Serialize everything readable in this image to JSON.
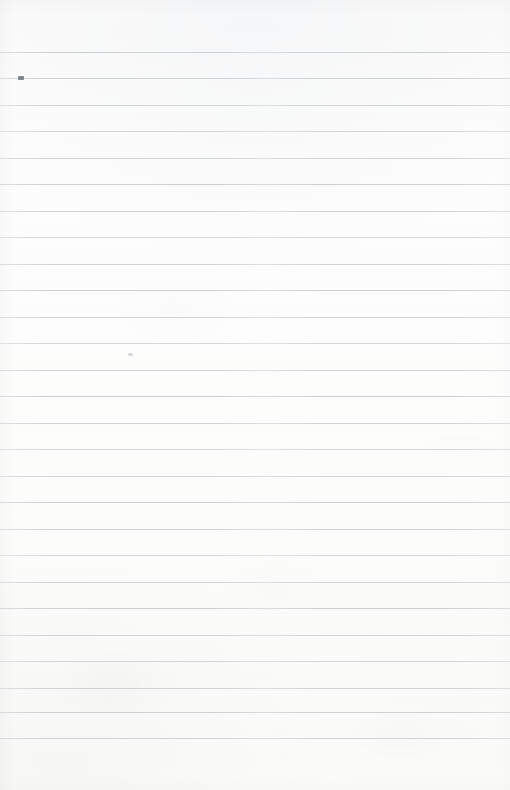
{
  "document": {
    "kind": "lined-notebook-paper-scan",
    "orientation": "portrait",
    "width_px": 510,
    "height_px": 790,
    "written_content": "",
    "visible_text": ""
  },
  "paper": {
    "background_color": "#fcfcfc",
    "rule_color": "#c9ced1",
    "rule_thickness_px": 1,
    "rule_spacing_px": 26.4,
    "first_rule_y": 52,
    "last_rule_y": 738,
    "rule_count": 27,
    "rule_left_x": 0,
    "rule_right_x": 510,
    "has_vertical_margin_rule": false,
    "has_punch_holes": false,
    "top_margin_px": 52,
    "bottom_margin_px": 51
  },
  "rules": [
    {
      "y": 52,
      "fade": "fade-c"
    },
    {
      "y": 78,
      "fade": "fade-c"
    },
    {
      "y": 105,
      "fade": "fade-a"
    },
    {
      "y": 131,
      "fade": "fade-b"
    },
    {
      "y": 158,
      "fade": "fade-a"
    },
    {
      "y": 184,
      "fade": "fade-c"
    },
    {
      "y": 211,
      "fade": "fade-a"
    },
    {
      "y": 237,
      "fade": "fade-b"
    },
    {
      "y": 264,
      "fade": "fade-a"
    },
    {
      "y": 290,
      "fade": "fade-c"
    },
    {
      "y": 317,
      "fade": "fade-a"
    },
    {
      "y": 343,
      "fade": "fade-b"
    },
    {
      "y": 370,
      "fade": "fade-a"
    },
    {
      "y": 396,
      "fade": "fade-c"
    },
    {
      "y": 423,
      "fade": "fade-a"
    },
    {
      "y": 449,
      "fade": "fade-b"
    },
    {
      "y": 476,
      "fade": "fade-a"
    },
    {
      "y": 502,
      "fade": "fade-c"
    },
    {
      "y": 529,
      "fade": "fade-a"
    },
    {
      "y": 555,
      "fade": "fade-d"
    },
    {
      "y": 582,
      "fade": "fade-a"
    },
    {
      "y": 608,
      "fade": "fade-c"
    },
    {
      "y": 635,
      "fade": "fade-a"
    },
    {
      "y": 661,
      "fade": "fade-b"
    },
    {
      "y": 688,
      "fade": "fade-a"
    },
    {
      "y": 712,
      "fade": "fade-c"
    },
    {
      "y": 738,
      "fade": "fade-a"
    }
  ],
  "artifacts": [
    {
      "name": "ink-smudge",
      "x": 18,
      "y": 76,
      "kind": "smudge"
    },
    {
      "name": "faint-speck",
      "x": 128,
      "y": 353,
      "kind": "speck"
    }
  ]
}
